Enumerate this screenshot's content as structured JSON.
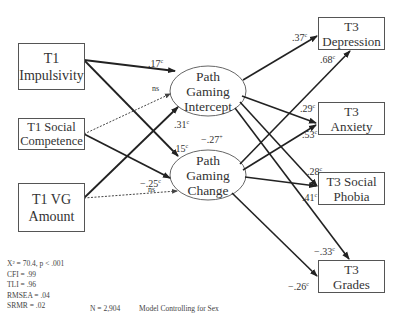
{
  "predictors": [
    {
      "line1": "T1",
      "line2": "Impulsivity"
    },
    {
      "line1": "T1 Social",
      "line2": "Competence"
    },
    {
      "line1": "T1 VG",
      "line2": "Amount"
    }
  ],
  "latents": [
    {
      "line1": "Path",
      "line2": "Gaming",
      "line3": "Intercept"
    },
    {
      "line1": "Path",
      "line2": "Gaming",
      "line3": "Change"
    }
  ],
  "outcomes": [
    {
      "line1": "T3",
      "line2": "Depression"
    },
    {
      "line1": "T3",
      "line2": "Anxiety"
    },
    {
      "line1": "T3 Social",
      "line2": "Phobia"
    },
    {
      "line1": "T3",
      "line2": "Grades"
    }
  ],
  "paths": {
    "imp_int": {
      "value": ".17",
      "sig": "c"
    },
    "soc_int": {
      "value": "ns",
      "sig": ""
    },
    "vg_int": {
      "value": ".31",
      "sig": "c"
    },
    "imp_chg": {
      "value": ".15",
      "sig": "c"
    },
    "soc_chg": {
      "value": "−.25",
      "sig": "c"
    },
    "vg_chg": {
      "value": "ns",
      "sig": ""
    },
    "int_chg_cov": {
      "value": "−.27",
      "sig": "+"
    },
    "int_dep": {
      "value": ".37",
      "sig": "c"
    },
    "chg_dep": {
      "value": ".68",
      "sig": "c"
    },
    "int_anx": {
      "value": ".29",
      "sig": "c"
    },
    "chg_anx": {
      "value": ".53",
      "sig": "c"
    },
    "int_soc": {
      "value": ".28",
      "sig": "c"
    },
    "chg_soc": {
      "value": ".41",
      "sig": "c"
    },
    "int_gra": {
      "value": "−.33",
      "sig": "c"
    },
    "chg_gra": {
      "value": "−.26",
      "sig": "c"
    }
  },
  "fit": {
    "chi": "X² = 70.4, p < .001",
    "cfi": "CFI = .99",
    "tli": "TLI = .96",
    "rmsea": "RMSEA = .04",
    "srmr": "SRMR = .02"
  },
  "footer": {
    "n": "N = 2,904",
    "note": "Model Controlling for Sex"
  }
}
